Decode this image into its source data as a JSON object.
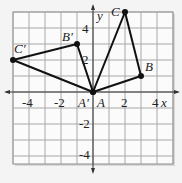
{
  "diagram": {
    "type": "coordinate-plane-rotation",
    "x_axis_label": "x",
    "y_axis_label": "y",
    "x_range": [
      -5,
      5
    ],
    "y_range": [
      -4.5,
      5
    ],
    "x_ticks": [
      {
        "value": -4,
        "label": "-4"
      },
      {
        "value": -2,
        "label": "-2"
      },
      {
        "value": 2,
        "label": "2"
      },
      {
        "value": 4,
        "label": "4"
      }
    ],
    "y_ticks": [
      {
        "value": 4,
        "label": "4"
      },
      {
        "value": 2,
        "label": "2"
      },
      {
        "value": -2,
        "label": "-2"
      },
      {
        "value": -4,
        "label": "-4"
      }
    ],
    "original_triangle": {
      "name": "ABC",
      "points": [
        {
          "label": "A",
          "x": 0,
          "y": 0
        },
        {
          "label": "B",
          "x": 3,
          "y": 1
        },
        {
          "label": "C",
          "x": 2,
          "y": 5
        }
      ]
    },
    "image_triangle": {
      "name": "A'B'C'",
      "points": [
        {
          "label": "A'",
          "x": 0,
          "y": 0
        },
        {
          "label": "B'",
          "x": -1,
          "y": 3
        },
        {
          "label": "C'",
          "x": -5,
          "y": 2
        }
      ]
    },
    "colors": {
      "background": "#f4f4f4",
      "grid": "#9a9a9a",
      "axis": "#333333",
      "triangle": "#111111"
    }
  }
}
